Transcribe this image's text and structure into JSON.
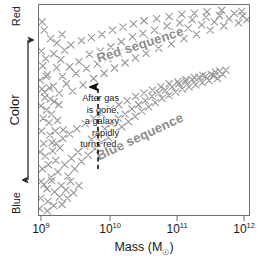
{
  "chart_data": {
    "type": "scatter",
    "title": "",
    "xlabel": "Mass (M☉)",
    "ylabel": "Color",
    "xlabel_text": "Mass (M",
    "xlabel_suffix": ")",
    "xscale": "log",
    "xlim": [
      1000000000.0,
      1000000000000.0
    ],
    "xtick_labels": [
      "10⁹",
      "10¹⁰",
      "10¹¹",
      "10¹²"
    ],
    "xticks_mantissa": [
      "10",
      "10",
      "10",
      "10"
    ],
    "xticks_exponent": [
      "9",
      "10",
      "11",
      "12"
    ],
    "y_axis_top_label": "Red",
    "y_axis_bottom_label": "Blue",
    "y_axis_ticks": "none",
    "grid": false,
    "legend": "none",
    "marker": "x",
    "marker_color": "#9a9a9a",
    "frame_color": "#6e6e6e",
    "annotations": [
      {
        "name": "red-sequence",
        "text": "Red sequence",
        "rotation_deg": -18,
        "color": "#8c8c8c"
      },
      {
        "name": "blue-sequence",
        "text": "Blue sequence",
        "rotation_deg": -25,
        "color": "#8c8c8c"
      },
      {
        "name": "transition-note",
        "text": "After gas\nis gone,\na galaxy\nrapidly\nturns red.",
        "color": "#1a1a1a",
        "pointer": "dashed-arrow-up",
        "pointer_x_value": 5000000000.0
      }
    ],
    "series": [
      {
        "name": "Red sequence",
        "description": "Upper locus of red, quiescent galaxies running from low mass blue-ward to high mass red-ward",
        "points": [
          [
            0.5,
            64.2
          ],
          [
            1.8,
            71.0
          ],
          [
            2.6,
            58.5
          ],
          [
            4.0,
            66.8
          ],
          [
            5.4,
            55.2
          ],
          [
            1.1,
            78.0
          ],
          [
            3.2,
            74.5
          ],
          [
            6.8,
            61.4
          ],
          [
            8.4,
            70.2
          ],
          [
            7.0,
            76.8
          ],
          [
            9.6,
            58.0
          ],
          [
            11.2,
            66.0
          ],
          [
            10.4,
            74.0
          ],
          [
            13.0,
            62.5
          ],
          [
            14.6,
            70.6
          ],
          [
            12.2,
            78.5
          ],
          [
            16.0,
            59.0
          ],
          [
            17.6,
            67.4
          ],
          [
            19.0,
            73.0
          ],
          [
            15.2,
            81.0
          ],
          [
            21.0,
            62.0
          ],
          [
            22.6,
            69.8
          ],
          [
            24.0,
            76.5
          ],
          [
            20.2,
            83.0
          ],
          [
            26.0,
            65.0
          ],
          [
            27.8,
            72.0
          ],
          [
            29.2,
            78.0
          ],
          [
            25.0,
            84.5
          ],
          [
            31.0,
            67.5
          ],
          [
            32.8,
            74.5
          ],
          [
            34.2,
            80.0
          ],
          [
            30.0,
            86.0
          ],
          [
            36.0,
            70.0
          ],
          [
            37.8,
            76.8
          ],
          [
            39.2,
            82.5
          ],
          [
            35.0,
            88.0
          ],
          [
            41.0,
            72.5
          ],
          [
            42.8,
            79.0
          ],
          [
            44.5,
            84.8
          ],
          [
            40.0,
            89.5
          ],
          [
            46.0,
            74.8
          ],
          [
            47.8,
            81.0
          ],
          [
            49.5,
            86.5
          ],
          [
            45.0,
            91.0
          ],
          [
            51.0,
            77.0
          ],
          [
            53.0,
            83.0
          ],
          [
            55.0,
            88.0
          ],
          [
            50.0,
            92.5
          ],
          [
            57.0,
            79.5
          ],
          [
            59.0,
            85.0
          ],
          [
            61.0,
            90.0
          ],
          [
            56.0,
            93.5
          ],
          [
            63.0,
            81.5
          ],
          [
            65.0,
            87.0
          ],
          [
            67.0,
            91.5
          ],
          [
            62.0,
            94.5
          ],
          [
            69.0,
            84.0
          ],
          [
            71.0,
            89.0
          ],
          [
            73.0,
            93.0
          ],
          [
            68.0,
            95.5
          ],
          [
            75.0,
            86.0
          ],
          [
            77.5,
            90.5
          ],
          [
            79.5,
            94.2
          ],
          [
            74.0,
            96.0
          ],
          [
            81.5,
            88.0
          ],
          [
            83.5,
            92.0
          ],
          [
            86.0,
            95.0
          ],
          [
            80.0,
            96.8
          ],
          [
            88.0,
            90.0
          ],
          [
            90.5,
            93.5
          ],
          [
            93.0,
            96.0
          ],
          [
            87.0,
            97.5
          ],
          [
            95.0,
            91.5
          ],
          [
            97.0,
            94.8
          ],
          [
            96.5,
            97.0
          ],
          [
            99.0,
            93.0
          ]
        ]
      },
      {
        "name": "Blue sequence",
        "description": "Lower locus of blue, star-forming galaxies rising toward redder colors with increasing mass",
        "points": [
          [
            0.8,
            8.0
          ],
          [
            2.4,
            14.5
          ],
          [
            4.2,
            6.5
          ],
          [
            5.8,
            18.0
          ],
          [
            7.4,
            11.0
          ],
          [
            1.6,
            22.0
          ],
          [
            9.0,
            20.5
          ],
          [
            3.0,
            28.0
          ],
          [
            10.6,
            14.0
          ],
          [
            12.2,
            24.0
          ],
          [
            6.5,
            30.5
          ],
          [
            13.8,
            18.5
          ],
          [
            15.4,
            27.0
          ],
          [
            8.2,
            34.0
          ],
          [
            17.0,
            22.0
          ],
          [
            18.6,
            30.0
          ],
          [
            11.4,
            36.5
          ],
          [
            20.2,
            25.5
          ],
          [
            21.8,
            33.0
          ],
          [
            14.6,
            38.5
          ],
          [
            23.4,
            28.5
          ],
          [
            25.0,
            36.0
          ],
          [
            18.0,
            41.0
          ],
          [
            26.6,
            31.5
          ],
          [
            28.2,
            38.5
          ],
          [
            22.0,
            43.5
          ],
          [
            29.8,
            34.5
          ],
          [
            31.4,
            41.0
          ],
          [
            26.0,
            46.0
          ],
          [
            33.0,
            37.0
          ],
          [
            34.6,
            43.5
          ],
          [
            30.0,
            48.0
          ],
          [
            36.2,
            39.5
          ],
          [
            37.8,
            46.0
          ],
          [
            34.0,
            50.5
          ],
          [
            39.4,
            42.0
          ],
          [
            41.0,
            48.0
          ],
          [
            38.0,
            52.5
          ],
          [
            42.6,
            44.5
          ],
          [
            44.2,
            50.5
          ],
          [
            42.0,
            54.5
          ],
          [
            45.8,
            47.0
          ],
          [
            47.4,
            52.5
          ],
          [
            46.0,
            56.5
          ],
          [
            49.0,
            49.5
          ],
          [
            50.6,
            54.5
          ],
          [
            50.0,
            58.0
          ],
          [
            52.2,
            51.5
          ],
          [
            53.8,
            56.5
          ],
          [
            54.0,
            59.5
          ],
          [
            55.4,
            53.5
          ],
          [
            57.0,
            58.0
          ],
          [
            58.0,
            61.0
          ],
          [
            58.6,
            55.5
          ],
          [
            60.2,
            59.5
          ],
          [
            62.0,
            62.5
          ],
          [
            61.8,
            57.0
          ],
          [
            63.4,
            61.0
          ],
          [
            66.0,
            63.5
          ],
          [
            65.0,
            58.5
          ],
          [
            66.6,
            62.5
          ],
          [
            70.0,
            64.5
          ],
          [
            68.2,
            60.0
          ],
          [
            69.8,
            63.5
          ],
          [
            74.0,
            65.5
          ],
          [
            71.4,
            61.0
          ],
          [
            73.0,
            64.5
          ],
          [
            78.0,
            66.5
          ],
          [
            74.6,
            62.0
          ],
          [
            76.2,
            65.5
          ],
          [
            82.0,
            67.0
          ],
          [
            77.8,
            63.0
          ],
          [
            79.4,
            66.0
          ],
          [
            84.0,
            68.0
          ],
          [
            81.0,
            64.0
          ],
          [
            83.0,
            66.5
          ],
          [
            86.0,
            68.5
          ],
          [
            85.0,
            65.0
          ],
          [
            87.5,
            67.0
          ],
          [
            89.0,
            69.0
          ]
        ]
      },
      {
        "name": "Low-mass scatter",
        "description": "Diffuse low-mass galaxies spread across the color range at the left edge",
        "points": [
          [
            0.3,
            3.0
          ],
          [
            1.2,
            40.0
          ],
          [
            2.0,
            46.0
          ],
          [
            0.9,
            52.0
          ],
          [
            3.6,
            50.0
          ],
          [
            2.8,
            56.0
          ],
          [
            1.4,
            60.0
          ],
          [
            4.8,
            44.0
          ],
          [
            5.0,
            60.5
          ],
          [
            6.0,
            48.0
          ],
          [
            3.4,
            66.0
          ],
          [
            7.8,
            40.0
          ],
          [
            0.6,
            30.0
          ],
          [
            2.2,
            34.0
          ],
          [
            4.5,
            24.0
          ],
          [
            6.2,
            34.5
          ],
          [
            8.8,
            45.0
          ],
          [
            5.2,
            38.0
          ],
          [
            7.2,
            54.0
          ],
          [
            9.4,
            52.5
          ],
          [
            1.0,
            16.0
          ],
          [
            3.8,
            12.5
          ],
          [
            6.0,
            16.5
          ],
          [
            8.0,
            26.0
          ],
          [
            10.0,
            32.0
          ],
          [
            11.5,
            40.5
          ],
          [
            9.8,
            8.5
          ],
          [
            12.8,
            12.0
          ],
          [
            15.0,
            16.0
          ],
          [
            4.0,
            2.0
          ],
          [
            7.0,
            4.5
          ],
          [
            11.0,
            5.0
          ],
          [
            13.5,
            8.0
          ],
          [
            16.5,
            10.5
          ],
          [
            19.0,
            14.0
          ],
          [
            2.5,
            88.0
          ],
          [
            5.5,
            84.0
          ],
          [
            8.5,
            82.0
          ],
          [
            1.5,
            92.0
          ],
          [
            11.0,
            86.0
          ]
        ]
      }
    ]
  },
  "axes": {
    "x": {
      "title_prefix": "Mass (M",
      "title_sun": "☉",
      "title_suffix": ")",
      "ticks": [
        {
          "base": "10",
          "exp": "9",
          "pos_pct": 1.4
        },
        {
          "base": "10",
          "exp": "10",
          "pos_pct": 34.0
        },
        {
          "base": "10",
          "exp": "11",
          "pos_pct": 65.6
        },
        {
          "base": "10",
          "exp": "12",
          "pos_pct": 97.2
        }
      ]
    },
    "y": {
      "title": "Color",
      "top_label": "Red",
      "bottom_label": "Blue"
    }
  },
  "labels": {
    "red_sequence": "Red sequence",
    "blue_sequence": "Blue sequence",
    "annotation": "After gas\nis gone,\na galaxy\nrapidly\nturns red."
  }
}
